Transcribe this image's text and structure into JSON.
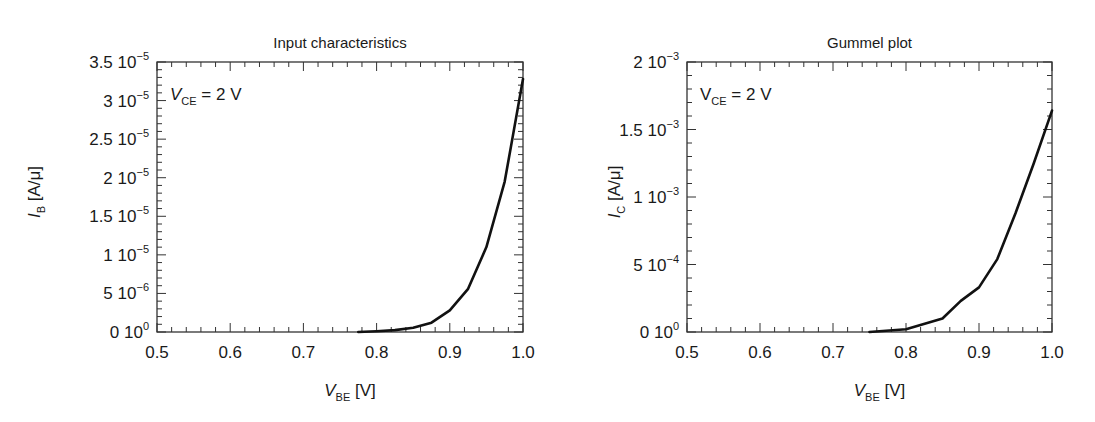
{
  "chart_data": [
    {
      "type": "line",
      "title": "Input characteristics",
      "annotation": {
        "var": "V",
        "sub": "CE",
        "rest": " = 2 V",
        "italic": true
      },
      "xlabel": {
        "var": "V",
        "sub": "BE",
        "unit": "[V]"
      },
      "ylabel": {
        "var": "I",
        "sub": "B",
        "unit": "[A/μ]"
      },
      "xlim": [
        0.5,
        1.0
      ],
      "ylim": [
        0,
        3.5e-05
      ],
      "x_ticks": [
        "0.5",
        "0.6",
        "0.7",
        "0.8",
        "0.9",
        "1.0"
      ],
      "y_ticks": [
        {
          "mant": "0",
          "exp": "0",
          "value": 0
        },
        {
          "mant": "5",
          "exp": "−6",
          "value": 5e-06
        },
        {
          "mant": "1",
          "exp": "−5",
          "value": 1e-05
        },
        {
          "mant": "1.5",
          "exp": "−5",
          "value": 1.5e-05
        },
        {
          "mant": "2",
          "exp": "−5",
          "value": 2e-05
        },
        {
          "mant": "2.5",
          "exp": "−5",
          "value": 2.5e-05
        },
        {
          "mant": "3",
          "exp": "−5",
          "value": 3e-05
        },
        {
          "mant": "3.5",
          "exp": "−5",
          "value": 3.5e-05
        }
      ],
      "grid": false,
      "legend": null,
      "series": [
        {
          "name": "I_B",
          "x": [
            0.775,
            0.8,
            0.825,
            0.85,
            0.875,
            0.9,
            0.925,
            0.95,
            0.975,
            1.0
          ],
          "values": [
            0,
            1e-07,
            2.5e-07,
            5.5e-07,
            1.2e-06,
            2.8e-06,
            5.6e-06,
            1.1e-05,
            1.95e-05,
            3.28e-05
          ]
        }
      ]
    },
    {
      "type": "line",
      "title": "Gummel plot",
      "annotation": {
        "var": "V",
        "sub": "CE",
        "rest": " = 2 V",
        "italic": false
      },
      "xlabel": {
        "var": "V",
        "sub": "BE",
        "unit": "[V]"
      },
      "ylabel": {
        "var": "I",
        "sub": "C",
        "unit": "[A/μ]"
      },
      "xlim": [
        0.5,
        1.0
      ],
      "ylim": [
        0,
        0.002
      ],
      "x_ticks": [
        "0.5",
        "0.6",
        "0.7",
        "0.8",
        "0.9",
        "1.0"
      ],
      "y_ticks": [
        {
          "mant": "0",
          "exp": "0",
          "value": 0
        },
        {
          "mant": "5",
          "exp": "−4",
          "value": 0.0005
        },
        {
          "mant": "1",
          "exp": "−3",
          "value": 0.001
        },
        {
          "mant": "1.5",
          "exp": "−3",
          "value": 0.0015
        },
        {
          "mant": "2",
          "exp": "−3",
          "value": 0.002
        }
      ],
      "grid": false,
      "legend": null,
      "series": [
        {
          "name": "I_C",
          "x": [
            0.75,
            0.8,
            0.85,
            0.875,
            0.9,
            0.925,
            0.95,
            0.975,
            1.0
          ],
          "values": [
            0,
            2e-05,
            0.0001,
            0.00023,
            0.00033,
            0.00054,
            0.00088,
            0.00125,
            0.00164
          ]
        }
      ]
    }
  ],
  "style": {
    "line_color": "#111111",
    "axis_color": "#333333",
    "text_color": "#1a1a1a"
  }
}
